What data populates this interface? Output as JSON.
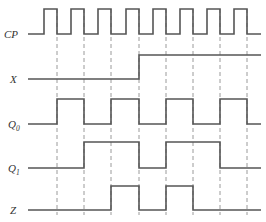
{
  "figure": {
    "type": "timing-diagram",
    "title": "",
    "background_color": "#ffffff",
    "wave_color": "#555555",
    "grid_color": "#9a9a9a",
    "label_color": "#333333",
    "time_origin_px": 28,
    "clock_period_px": 27.4,
    "grid_lines_px": [
      57,
      84,
      111,
      139,
      166,
      193,
      220,
      247
    ],
    "plot_right_px": 261
  },
  "signals": [
    {
      "name": "CP",
      "label": "CP",
      "subscript": "",
      "baseline_y": 34,
      "top_y": 9,
      "label_x": 4,
      "label_y": 38,
      "description": "Clock pulse train, 8 full periods, active-high pulses",
      "transitions_px": [
        {
          "x": 44,
          "level": 1
        },
        {
          "x": 57,
          "level": 0
        },
        {
          "x": 71,
          "level": 1
        },
        {
          "x": 84,
          "level": 0
        },
        {
          "x": 98,
          "level": 1
        },
        {
          "x": 111,
          "level": 0
        },
        {
          "x": 126,
          "level": 1
        },
        {
          "x": 139,
          "level": 0
        },
        {
          "x": 153,
          "level": 1
        },
        {
          "x": 166,
          "level": 0
        },
        {
          "x": 180,
          "level": 1
        },
        {
          "x": 193,
          "level": 0
        },
        {
          "x": 207,
          "level": 1
        },
        {
          "x": 220,
          "level": 0
        },
        {
          "x": 234,
          "level": 1
        },
        {
          "x": 247,
          "level": 0
        }
      ],
      "start_level": 0,
      "end_x": 261
    },
    {
      "name": "X",
      "label": "X",
      "subscript": "",
      "baseline_y": 79,
      "top_y": 55,
      "label_x": 10,
      "label_y": 83,
      "description": "Input X, low until 4th clock, then high",
      "transitions_px": [
        {
          "x": 139,
          "level": 1
        }
      ],
      "start_level": 0,
      "end_x": 261
    },
    {
      "name": "Q0",
      "label": "Q",
      "subscript": "0",
      "baseline_y": 124,
      "top_y": 99,
      "label_x": 8,
      "label_y": 128,
      "description": "Flip-flop Q0 output, toggles each clock period",
      "transitions_px": [
        {
          "x": 57,
          "level": 1
        },
        {
          "x": 84,
          "level": 0
        },
        {
          "x": 111,
          "level": 1
        },
        {
          "x": 139,
          "level": 0
        },
        {
          "x": 166,
          "level": 1
        },
        {
          "x": 193,
          "level": 0
        },
        {
          "x": 220,
          "level": 1
        },
        {
          "x": 247,
          "level": 0
        }
      ],
      "start_level": 0,
      "end_x": 261
    },
    {
      "name": "Q1",
      "label": "Q",
      "subscript": "1",
      "baseline_y": 168,
      "top_y": 142,
      "label_x": 8,
      "label_y": 172,
      "description": "Flip-flop Q1 output",
      "transitions_px": [
        {
          "x": 84,
          "level": 1
        },
        {
          "x": 139,
          "level": 0
        },
        {
          "x": 166,
          "level": 1
        },
        {
          "x": 220,
          "level": 0
        }
      ],
      "start_level": 0,
      "end_x": 261
    },
    {
      "name": "Z",
      "label": "Z",
      "subscript": "",
      "baseline_y": 210,
      "top_y": 186,
      "label_x": 10,
      "label_y": 214,
      "description": "Output Z, asserted during two intervals",
      "transitions_px": [
        {
          "x": 111,
          "level": 1
        },
        {
          "x": 139,
          "level": 0
        },
        {
          "x": 166,
          "level": 1
        },
        {
          "x": 193,
          "level": 0
        }
      ],
      "start_level": 0,
      "end_x": 261
    }
  ],
  "grid": {
    "top_y": 9,
    "bottom_y": 215,
    "enabled": true
  }
}
